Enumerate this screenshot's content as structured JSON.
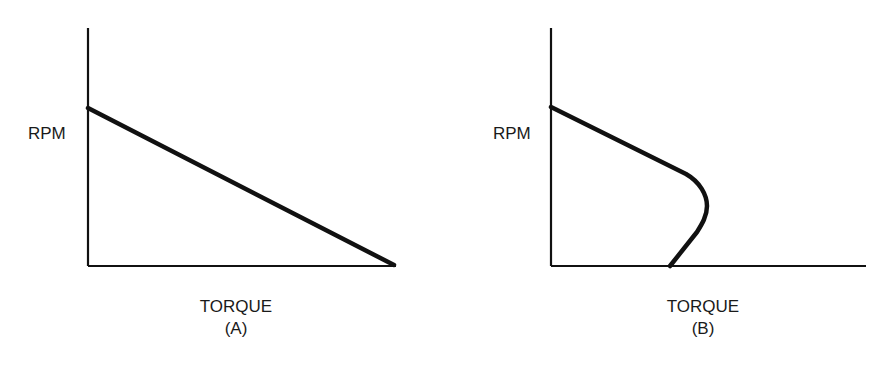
{
  "panels": [
    {
      "id": "A",
      "y_label": "RPM",
      "x_label": "TORQUE",
      "caption": "(A)",
      "curve": "straight line decreasing from max RPM at zero torque to zero RPM at max torque"
    },
    {
      "id": "B",
      "y_label": "RPM",
      "x_label": "TORQUE",
      "caption": "(B)",
      "curve": "RPM falls linearly with torque, then bends back at a peak (breakdown) torque and returns to zero RPM at lower torque"
    }
  ],
  "colors": {
    "line": "#111111",
    "background": "#ffffff",
    "text": "#1a1a1a"
  }
}
